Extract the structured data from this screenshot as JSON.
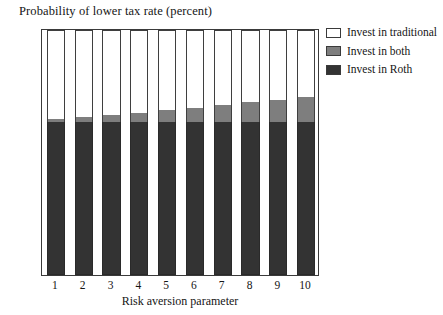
{
  "chart_data": {
    "type": "bar",
    "stacked": true,
    "title": "Probability of lower tax rate (percent)",
    "xlabel": "Risk aversion parameter",
    "ylabel": "",
    "categories": [
      "1",
      "2",
      "3",
      "4",
      "5",
      "6",
      "7",
      "8",
      "9",
      "10"
    ],
    "ylim": [
      0,
      1
    ],
    "xlim_labels": [
      "1",
      "10"
    ],
    "yticks": [
      "0.1",
      "0.2",
      "0.3",
      "0.4",
      "0.5",
      "0.6",
      "0.7",
      "0.8",
      "0.9"
    ],
    "ytick_values": [
      0.1,
      0.2,
      0.3,
      0.4,
      0.5,
      0.6,
      0.7,
      0.8,
      0.9
    ],
    "grid": false,
    "legend_position": "upper-right-outside",
    "series": [
      {
        "name": "Invest in Roth",
        "color": "#333333",
        "values": [
          0.625,
          0.625,
          0.625,
          0.625,
          0.625,
          0.625,
          0.625,
          0.625,
          0.625,
          0.625
        ]
      },
      {
        "name": "Invest in both",
        "color": "#7e7e7e",
        "values": [
          0.012,
          0.018,
          0.027,
          0.037,
          0.048,
          0.058,
          0.07,
          0.08,
          0.09,
          0.1
        ]
      },
      {
        "name": "Invest in traditional",
        "color": "#ffffff",
        "values": [
          0.363,
          0.357,
          0.348,
          0.338,
          0.327,
          0.317,
          0.305,
          0.295,
          0.285,
          0.275
        ]
      }
    ],
    "cumulative_tops": {
      "roth": [
        0.625,
        0.625,
        0.625,
        0.625,
        0.625,
        0.625,
        0.625,
        0.625,
        0.625,
        0.625
      ],
      "both": [
        0.637,
        0.643,
        0.652,
        0.662,
        0.673,
        0.683,
        0.695,
        0.705,
        0.715,
        0.725
      ],
      "traditional": [
        1.0,
        1.0,
        1.0,
        1.0,
        1.0,
        1.0,
        1.0,
        1.0,
        1.0,
        1.0
      ]
    }
  },
  "legend": {
    "items": [
      {
        "label": "Invest in traditional"
      },
      {
        "label": "Invest in both"
      },
      {
        "label": "Invest in Roth"
      }
    ]
  }
}
